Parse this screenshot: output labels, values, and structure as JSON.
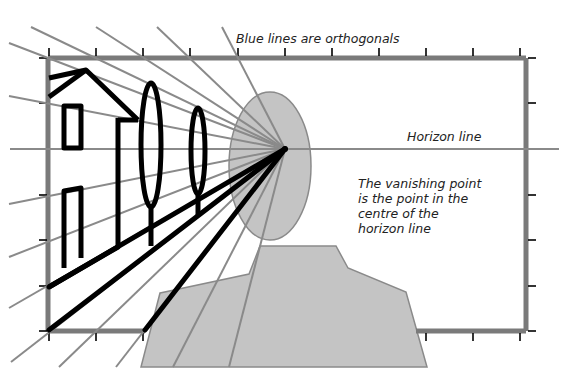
{
  "diagram": {
    "labels": {
      "orthogonals": "Blue lines are orthogonals",
      "horizon": "Horizon line",
      "vanishing_point_lines": [
        "The vanishing point",
        "is the point in the",
        "centre of the",
        "horizon line"
      ]
    },
    "vanishing_point": {
      "x": 285,
      "y": 149
    },
    "colors": {
      "orthogonal_line": "#8a8a8a",
      "frame": "#7a7a7a",
      "figure_fill": "#c4c4c4",
      "figure_stroke": "#8a8a8a",
      "drawing_stroke": "#000000",
      "tick": "#000000",
      "text": "#222222"
    },
    "elements": [
      "picture-frame",
      "horizon-line",
      "orthogonal-lines",
      "viewer-head",
      "viewer-shoulders",
      "house",
      "tall-tree",
      "short-tree",
      "road-edges"
    ]
  }
}
